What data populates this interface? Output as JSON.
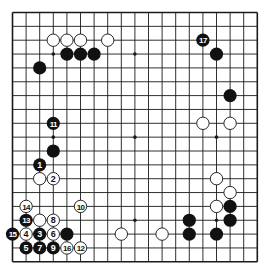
{
  "board": {
    "size": 19,
    "origin_x": 12.5,
    "origin_y": 12.5,
    "spacing_x": 13.6,
    "spacing_y": 13.85,
    "stone_radius": 6.6,
    "line_color": "#1a1a1a",
    "background": "#ffffff",
    "black_color": "#111111",
    "white_fill": "#ffffff",
    "white_stroke": "#111111"
  },
  "hoshi": [
    [
      3,
      3
    ],
    [
      9,
      3
    ],
    [
      15,
      3
    ],
    [
      3,
      9
    ],
    [
      9,
      9
    ],
    [
      15,
      9
    ],
    [
      3,
      15
    ],
    [
      9,
      15
    ],
    [
      15,
      15
    ]
  ],
  "black_stones": [
    [
      2,
      4
    ],
    [
      4,
      3
    ],
    [
      5,
      3
    ],
    [
      6,
      3
    ],
    [
      15,
      3
    ],
    [
      16,
      6
    ],
    [
      3,
      10
    ],
    [
      4,
      16
    ],
    [
      13,
      15
    ],
    [
      13,
      16
    ],
    [
      15,
      16
    ],
    [
      16,
      14
    ],
    [
      16,
      15
    ]
  ],
  "white_stones": [
    [
      3,
      2
    ],
    [
      4,
      2
    ],
    [
      5,
      2
    ],
    [
      7,
      2
    ],
    [
      14,
      8
    ],
    [
      16,
      8
    ],
    [
      15,
      12
    ],
    [
      16,
      13
    ],
    [
      15,
      14
    ],
    [
      2,
      12
    ],
    [
      2,
      15
    ],
    [
      8,
      16
    ],
    [
      11,
      16
    ]
  ],
  "moves": [
    {
      "n": "1",
      "color": "black",
      "x": 2,
      "y": 11
    },
    {
      "n": "2",
      "color": "white",
      "x": 3,
      "y": 12
    },
    {
      "n": "3",
      "color": "black",
      "x": 2,
      "y": 16
    },
    {
      "n": "4",
      "color": "white",
      "x": 1,
      "y": 16
    },
    {
      "n": "5",
      "color": "black",
      "x": 1,
      "y": 17
    },
    {
      "n": "6",
      "color": "white",
      "x": 3,
      "y": 16
    },
    {
      "n": "7",
      "color": "black",
      "x": 2,
      "y": 17
    },
    {
      "n": "8",
      "color": "white",
      "x": 3,
      "y": 15
    },
    {
      "n": "9",
      "color": "black",
      "x": 3,
      "y": 17
    },
    {
      "n": "10",
      "color": "white",
      "x": 5,
      "y": 14
    },
    {
      "n": "11",
      "color": "black",
      "x": 3,
      "y": 8
    },
    {
      "n": "12",
      "color": "white",
      "x": 5,
      "y": 17
    },
    {
      "n": "13",
      "color": "black",
      "x": 1,
      "y": 15
    },
    {
      "n": "14",
      "color": "white",
      "x": 1,
      "y": 14
    },
    {
      "n": "15",
      "color": "black",
      "x": 0,
      "y": 16
    },
    {
      "n": "16",
      "color": "white",
      "x": 4,
      "y": 17
    },
    {
      "n": "17",
      "color": "black",
      "x": 14,
      "y": 2
    }
  ]
}
